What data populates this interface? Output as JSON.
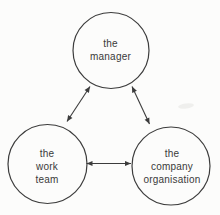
{
  "diagram": {
    "type": "relationship-triangle",
    "colors": {
      "background": "#fcfcfb",
      "line": "#3c3c3c",
      "text": "#3a3a3a"
    },
    "nodes": {
      "manager": {
        "shape": "circle",
        "lines": [
          "the",
          "manager"
        ]
      },
      "work_team": {
        "shape": "circle",
        "lines": [
          "the",
          "work",
          "team"
        ]
      },
      "company_organisation": {
        "shape": "circle",
        "lines": [
          "the",
          "company",
          "organisation"
        ]
      }
    },
    "edges": [
      {
        "from": "manager",
        "to": "work_team",
        "style": "double-headed-arrow",
        "bidirectional": true
      },
      {
        "from": "manager",
        "to": "company_organisation",
        "style": "double-headed-arrow",
        "bidirectional": true
      },
      {
        "from": "work_team",
        "to": "company_organisation",
        "style": "double-headed-arrow",
        "bidirectional": true
      }
    ]
  }
}
